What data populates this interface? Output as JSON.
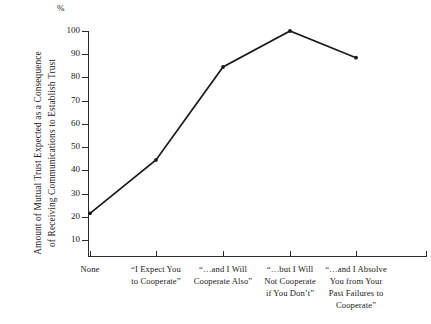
{
  "chart_data": {
    "type": "line",
    "title": "",
    "xlabel": "",
    "ylabel": "Amount of Mutual Trust Expected as a Consequence of Receiving Communications to Establish Trust",
    "ylabel_lines": [
      "Amount of Mutual Trust Expected as a Consequence",
      "of Receiving Communications to Establish Trust"
    ],
    "y_unit": "%",
    "ylim": [
      0,
      100
    ],
    "yticks": [
      10,
      20,
      30,
      40,
      50,
      60,
      70,
      80,
      90,
      100
    ],
    "ytick_labels": [
      "10",
      "20",
      "30",
      "40",
      "50",
      "60",
      "70",
      "80",
      "90",
      "100"
    ],
    "grid": false,
    "legend": "none",
    "categories": [
      "None",
      "“I Expect You to Cooperate”",
      "“…and I Will Cooperate Also”",
      "“…but I Will Not Cooperate if You Don’t”",
      "“…and I Absolve You from Your Past Failures to Cooperate”"
    ],
    "category_lines": [
      [
        "None"
      ],
      [
        "“I Expect You",
        "to Cooperate”"
      ],
      [
        "“…and I Will",
        "Cooperate Also”"
      ],
      [
        "“…but I Will",
        "Not Cooperate",
        "if You Don’t”"
      ],
      [
        "“…and I Absolve",
        "You from Your",
        "Past Failures to",
        "Cooperate”"
      ]
    ],
    "values": [
      21.5,
      44.5,
      84.5,
      100,
      88.5
    ],
    "series": [
      {
        "name": "Mutual trust expected",
        "values": [
          21.5,
          44.5,
          84.5,
          100,
          88.5
        ]
      }
    ],
    "line_color": "#1a1a1a",
    "marker": "dot",
    "background_color": "#ffffff"
  }
}
